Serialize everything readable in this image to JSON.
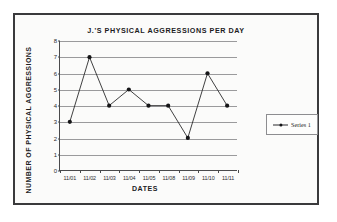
{
  "chart_data": {
    "type": "line",
    "title": "J.'S PHYSICAL AGGRESSIONS PER DAY",
    "xlabel": "DATES",
    "ylabel": "NUMBER OF PHYSICAL AGGRESSIONS",
    "categories": [
      "11/01",
      "11/02",
      "11/03",
      "11/04",
      "11/05",
      "11/08",
      "11/09",
      "11/10",
      "11/11"
    ],
    "values": [
      3,
      7,
      4,
      5,
      4,
      4,
      2,
      6,
      4
    ],
    "series": [
      {
        "name": "Series 1",
        "values": [
          3,
          7,
          4,
          5,
          4,
          4,
          2,
          6,
          4
        ]
      }
    ],
    "ylim": [
      0,
      8
    ],
    "ytick_labels": [
      "8",
      "7",
      "6",
      "5",
      "4",
      "3",
      "2",
      "1",
      "0"
    ],
    "ytick_values": [
      8,
      7,
      6,
      5,
      4,
      3,
      2,
      1,
      0
    ],
    "grid": "horizontal",
    "legend_position": "right",
    "legend_entries": [
      "Series 1"
    ],
    "marker": "filled-circle",
    "line_color": "#2a2a2c",
    "marker_color": "#151517",
    "grid_color": "#9a9a9c",
    "axis_color": "#4a4a4c",
    "plot_background": "#fbfbfa"
  }
}
